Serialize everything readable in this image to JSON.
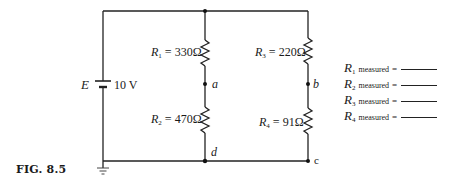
{
  "figure": {
    "label": "FIG. 8.5"
  },
  "source": {
    "name": "E",
    "value": "10 V"
  },
  "resistors": [
    {
      "id": "R1",
      "symbol": "R",
      "sub": "1",
      "value": "330Ω"
    },
    {
      "id": "R2",
      "symbol": "R",
      "sub": "2",
      "value": "470Ω"
    },
    {
      "id": "R3",
      "symbol": "R",
      "sub": "3",
      "value": "220Ω"
    },
    {
      "id": "R4",
      "symbol": "R",
      "sub": "4",
      "value": "91Ω"
    }
  ],
  "nodes": {
    "a": "a",
    "b": "b",
    "c": "c",
    "d": "d"
  },
  "measurements": [
    {
      "symbol": "R",
      "sub": "1",
      "word": "measured",
      "eq": "="
    },
    {
      "symbol": "R",
      "sub": "2",
      "word": "measured",
      "eq": "="
    },
    {
      "symbol": "R",
      "sub": "3",
      "word": "measured",
      "eq": "="
    },
    {
      "symbol": "R",
      "sub": "4",
      "word": "measured",
      "eq": "="
    }
  ]
}
